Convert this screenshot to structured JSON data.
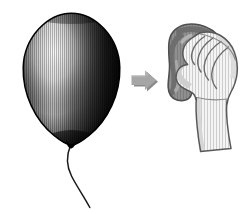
{
  "illustration": {
    "title": "Balloon rubbed with cloth",
    "caption": "A balloon on a string, an arrow, and a hand holding a cloth",
    "background_color": "#ffffff",
    "width": 250,
    "height": 214,
    "style": "black-and-white line art with vertical hatching"
  },
  "balloon": {
    "name": "balloon",
    "label": "Balloon",
    "outline_color": "#000000",
    "body_dark_color": "#141414",
    "body_mid_color": "#4a4a4a",
    "highlight_color": "#e8e8e8",
    "hatching_color": "#000000",
    "bounds": {
      "x": 22,
      "y": 13,
      "width": 98,
      "height": 134
    },
    "string": {
      "name": "balloon-string",
      "label": "String",
      "color": "#1a1a1a",
      "start": {
        "x": 70,
        "y": 146
      },
      "end": {
        "x": 90,
        "y": 208
      }
    },
    "knot": {
      "name": "balloon-knot",
      "label": "Knot",
      "color": "#000000"
    }
  },
  "arrow": {
    "name": "arrow-right",
    "label": "Arrow pointing right",
    "fill_color": "#a6a6a6",
    "shadow_color": "#8c8c8c",
    "direction": "right",
    "bounds": {
      "x": 131,
      "y": 70,
      "width": 26,
      "height": 22
    }
  },
  "hand": {
    "name": "hand",
    "label": "Hand",
    "skin_fill_color": "#f4f4f4",
    "outline_color": "#595959",
    "shadow_color": "#bdbdbd",
    "hatching_color": "#c8c8c8",
    "bounds": {
      "x": 168,
      "y": 22,
      "width": 72,
      "height": 130
    },
    "parts": [
      {
        "name": "finger-index",
        "label": "Index finger"
      },
      {
        "name": "finger-middle",
        "label": "Middle finger"
      },
      {
        "name": "finger-ring",
        "label": "Ring finger"
      },
      {
        "name": "finger-little",
        "label": "Little finger"
      },
      {
        "name": "thumb",
        "label": "Thumb"
      },
      {
        "name": "knuckles",
        "label": "Knuckles"
      },
      {
        "name": "wrist",
        "label": "Wrist"
      },
      {
        "name": "forearm",
        "label": "Forearm"
      }
    ]
  },
  "cloth": {
    "name": "cloth",
    "label": "Cloth",
    "fill_color": "#8f8f8f",
    "shade_color": "#767676",
    "highlight_color": "#b0b0b0",
    "outline_color": "#4f4f4f",
    "bounds": {
      "x": 168,
      "y": 24,
      "width": 54,
      "height": 78
    }
  }
}
